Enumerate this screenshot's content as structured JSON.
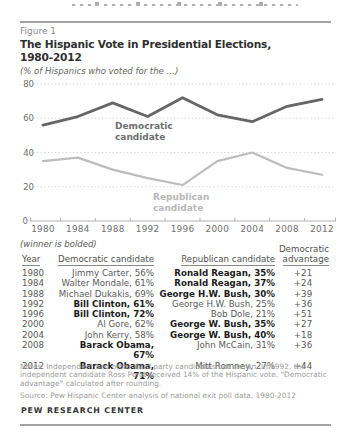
{
  "figure": {
    "label": "Figure 1",
    "title_line1": "The Hispanic Vote in Presidential Elections,",
    "title_line2": "1980-2012",
    "subtitle": "(% of Hispanics who voted for the …)"
  },
  "chart_data": {
    "type": "line",
    "x": [
      1980,
      1984,
      1988,
      1992,
      1996,
      2000,
      2004,
      2008,
      2012
    ],
    "series": [
      {
        "name": "Democratic candidate",
        "values": [
          56,
          61,
          69,
          61,
          72,
          62,
          58,
          67,
          71
        ],
        "color": "#666666",
        "width": 2.8
      },
      {
        "name": "Republican candidate",
        "values": [
          35,
          37,
          30,
          25,
          21,
          35,
          40,
          31,
          27
        ],
        "color": "#bcbcbc",
        "width": 2.2
      }
    ],
    "ylim": [
      0,
      80
    ],
    "yticks": [
      0,
      20,
      40,
      60,
      80
    ],
    "grid": "dotted-horizontal",
    "legend_position": "inline-annotations",
    "annotations": [
      {
        "lines": [
          "Democratic",
          "candidate"
        ],
        "x": 115,
        "y": 129,
        "color": "#6e6e6e"
      },
      {
        "lines": [
          "Republican",
          "candidate"
        ],
        "x": 153,
        "y": 200,
        "color": "#b8b8b8"
      }
    ]
  },
  "winner_note": "(winner is bolded)",
  "table": {
    "headers": {
      "year": "Year",
      "dem": "Democratic candidate",
      "rep": "Republican candidate",
      "adv_line1": "Democratic",
      "adv_line2": "advantage"
    },
    "rows": [
      {
        "year": "1980",
        "dem": "Jimmy Carter, 56%",
        "rep": "Ronald Reagan, 35%",
        "adv": "+21",
        "winner": "rep"
      },
      {
        "year": "1984",
        "dem": "Walter Mondale, 61%",
        "rep": "Ronald Reagan, 37%",
        "adv": "+24",
        "winner": "rep"
      },
      {
        "year": "1988",
        "dem": "Michael Dukakis, 69%",
        "rep": "George H.W. Bush, 30%",
        "adv": "+39",
        "winner": "rep"
      },
      {
        "year": "1992",
        "dem": "Bill Clinton, 61%",
        "rep": "George H.W. Bush, 25%",
        "adv": "+36",
        "winner": "dem"
      },
      {
        "year": "1996",
        "dem": "Bill Clinton, 72%",
        "rep": "Bob Dole, 21%",
        "adv": "+51",
        "winner": "dem"
      },
      {
        "year": "2000",
        "dem": "Al Gore, 62%",
        "rep": "George W. Bush, 35%",
        "adv": "+27",
        "winner": "rep"
      },
      {
        "year": "2004",
        "dem": "John Kerry, 58%",
        "rep": "George W. Bush, 40%",
        "adv": "+18",
        "winner": "rep"
      },
      {
        "year": "2008",
        "dem": "Barack Obama, 67%",
        "rep": "John McCain, 31%",
        "adv": "+36",
        "winner": "dem"
      },
      {
        "year": "2012",
        "dem": "Barack Obama, 71%",
        "rep": "Mitt Romney, 27%",
        "adv": "+44",
        "winner": "dem"
      }
    ]
  },
  "notes": "Notes: Independent and other third party candidates not shown. In 1992, the independent candidate Ross Perot received 14% of the Hispanic vote. “Democratic advantage” calculated after rounding.",
  "source": "Source: Pew Hispanic Center analysis of national exit poll data, 1980-2012",
  "footer": "PEW RESEARCH CENTER",
  "colors": {
    "democratic_line": "#666666",
    "republican_line": "#bcbcbc",
    "gridline": "#cdcdcd",
    "axis": "#b0b0b0",
    "rule": "#a3a3a3"
  }
}
